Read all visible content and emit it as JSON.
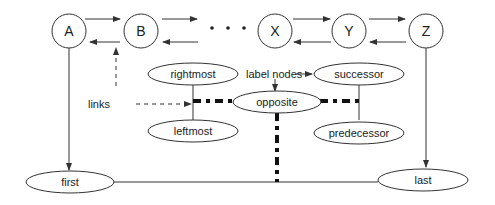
{
  "diagram": {
    "chain_nodes": [
      {
        "id": "A",
        "label": "A"
      },
      {
        "id": "B",
        "label": "B"
      },
      {
        "id": "X",
        "label": "X"
      },
      {
        "id": "Y",
        "label": "Y"
      },
      {
        "id": "Z",
        "label": "Z"
      }
    ],
    "ellipsis": "• • •",
    "label_nodes": {
      "rightmost": "rightmost",
      "leftmost": "leftmost",
      "opposite": "opposite",
      "successor": "successor",
      "predecessor": "predecessor",
      "first": "first",
      "last": "last"
    },
    "annotations": {
      "links": "links",
      "label_nodes": "label nodes"
    },
    "colors": {
      "stroke": "#333333",
      "background": "#ffffff"
    }
  }
}
